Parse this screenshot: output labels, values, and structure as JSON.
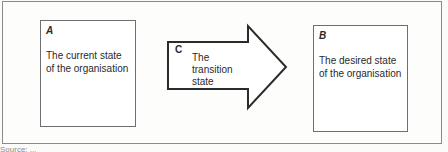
{
  "diagram": {
    "box_a": {
      "letter": "A",
      "text": "The current state of the organisation"
    },
    "arrow_c": {
      "letter": "C",
      "text": "The transition state"
    },
    "box_b": {
      "letter": "B",
      "text": "The desired state of the organisation"
    },
    "caption": "Source: ..."
  },
  "colors": {
    "border": "#6f6f6f",
    "arrow_stroke": "#2b2b2b",
    "frame": "#8a8a8a"
  }
}
